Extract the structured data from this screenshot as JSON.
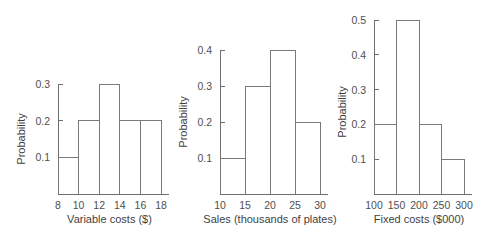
{
  "figure": {
    "background_color": "#ffffff",
    "line_color": "#6e6e6e",
    "bar_outline_color": "#7a7a7a",
    "text_color": "#4a4a4a",
    "panel_count": 3
  },
  "chart_data": [
    {
      "type": "bar",
      "title": "",
      "xlabel": "Variable costs ($)",
      "ylabel": "Probability",
      "categories": [
        "8-10",
        "10-12",
        "12-14",
        "14-16",
        "16-18"
      ],
      "bin_edges": [
        8,
        10,
        12,
        14,
        16,
        18
      ],
      "values": [
        0.1,
        0.2,
        0.3,
        0.2,
        0.2
      ],
      "xticks": [
        "8",
        "10",
        "12",
        "14",
        "16",
        "18"
      ],
      "xtick_values": [
        8,
        10,
        12,
        14,
        16,
        18
      ],
      "yticks": [
        "0.1",
        "0.2",
        "0.3"
      ],
      "ytick_values": [
        0.1,
        0.2,
        0.3
      ],
      "xlim": [
        8,
        18
      ],
      "ylim": [
        0,
        0.3
      ],
      "grid": false,
      "legend": false
    },
    {
      "type": "bar",
      "title": "",
      "xlabel": "Sales (thousands of plates)",
      "ylabel": "Probability",
      "categories": [
        "10-15",
        "15-20",
        "20-25",
        "25-30"
      ],
      "bin_edges": [
        10,
        15,
        20,
        25,
        30
      ],
      "values": [
        0.1,
        0.3,
        0.4,
        0.2
      ],
      "xticks": [
        "10",
        "15",
        "20",
        "25",
        "30"
      ],
      "xtick_values": [
        10,
        15,
        20,
        25,
        30
      ],
      "yticks": [
        "0.1",
        "0.2",
        "0.3",
        "0.4"
      ],
      "ytick_values": [
        0.1,
        0.2,
        0.3,
        0.4
      ],
      "xlim": [
        10,
        30
      ],
      "ylim": [
        0,
        0.4
      ],
      "grid": false,
      "legend": false
    },
    {
      "type": "bar",
      "title": "",
      "xlabel": "Fixed costs ($000)",
      "ylabel": "Probability",
      "categories": [
        "100-150",
        "150-200",
        "200-250",
        "250-300"
      ],
      "bin_edges": [
        100,
        150,
        200,
        250,
        300
      ],
      "values": [
        0.2,
        0.5,
        0.2,
        0.1
      ],
      "xticks": [
        "100",
        "150",
        "200",
        "250",
        "300"
      ],
      "xtick_values": [
        100,
        150,
        200,
        250,
        300
      ],
      "yticks": [
        "0.1",
        "0.2",
        "0.3",
        "0.4",
        "0.5"
      ],
      "ytick_values": [
        0.1,
        0.2,
        0.3,
        0.4,
        0.5
      ],
      "xlim": [
        100,
        300
      ],
      "ylim": [
        0,
        0.5
      ],
      "grid": false,
      "legend": false
    }
  ]
}
